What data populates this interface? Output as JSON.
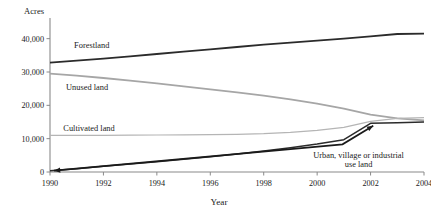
{
  "chart_data": {
    "type": "line",
    "title": "",
    "xlabel": "Year",
    "ylabel": "Acres",
    "x": [
      1990,
      1991,
      1992,
      1993,
      1994,
      1995,
      1996,
      1997,
      1998,
      1999,
      2000,
      2001,
      2002,
      2003,
      2004
    ],
    "xlim": [
      1990,
      2004
    ],
    "ylim": [
      0,
      45000
    ],
    "xticks": [
      "1990",
      "1992",
      "1994",
      "1996",
      "1998",
      "2000",
      "2002",
      "2004"
    ],
    "yticks": [
      "0",
      "10,000",
      "20,000",
      "30,000",
      "40,000"
    ],
    "ytick_values": [
      0,
      10000,
      20000,
      30000,
      40000
    ],
    "grid": false,
    "legend_position": "inline-labels",
    "series": [
      {
        "name": "Forestland",
        "color": "#2b2b2b",
        "width": 1.9,
        "label_x": 1990.9,
        "label_y": 37200,
        "values": [
          32800,
          33400,
          34000,
          34700,
          35400,
          36100,
          36800,
          37500,
          38200,
          38800,
          39400,
          40000,
          40700,
          41400,
          41500
        ]
      },
      {
        "name": "Unused land",
        "color": "#a6a6a6",
        "width": 1.9,
        "label_x": 1990.6,
        "label_y": 24600,
        "values": [
          29500,
          28900,
          28200,
          27400,
          26600,
          25700,
          24800,
          23900,
          22900,
          21800,
          20500,
          19000,
          17200,
          16100,
          15500
        ]
      },
      {
        "name": "Cultivated land",
        "color": "#b5b5b5",
        "width": 1.2,
        "label_x": 1990.5,
        "label_y": 12200,
        "values": [
          11000,
          11000,
          11000,
          11050,
          11100,
          11150,
          11200,
          11300,
          11500,
          11900,
          12500,
          13400,
          15200,
          16100,
          16300
        ]
      },
      {
        "name": "Urban, village or industrial use land",
        "color": "#2b2b2b",
        "width": 1.5,
        "values": [
          400,
          1000,
          1700,
          2400,
          3100,
          3800,
          4600,
          5400,
          6300,
          7300,
          8400,
          9700,
          14600,
          14800,
          15000
        ]
      }
    ],
    "annotation": {
      "line1": "Urban, village or industrial",
      "line2": "use land",
      "text_x": 2001.55,
      "text_y1": 4200,
      "text_y2": 1650,
      "arrow_tip_left_x": 1990.15,
      "arrow_tip_left_y": 400,
      "arrow_elbow_x": 2000.95,
      "arrow_elbow_y": 8300,
      "arrow_tip_right_x": 2002.1,
      "arrow_tip_right_y": 13900
    }
  }
}
